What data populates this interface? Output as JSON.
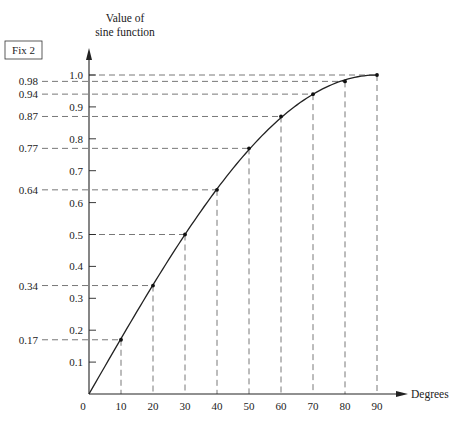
{
  "figure_label": "Fix 2",
  "chart_data": {
    "type": "line",
    "title": "",
    "xlabel": "Degrees",
    "ylabel": "Value of sine function",
    "ylabel_lines": [
      "Value of",
      "sine function"
    ],
    "x": [
      0,
      10,
      20,
      30,
      40,
      50,
      60,
      70,
      80,
      90
    ],
    "values": [
      0,
      0.17,
      0.34,
      0.5,
      0.64,
      0.77,
      0.87,
      0.94,
      0.98,
      1.0
    ],
    "series": [
      {
        "name": "sin(x)",
        "x": [
          0,
          10,
          20,
          30,
          40,
          50,
          60,
          70,
          80,
          90
        ],
        "values": [
          0,
          0.17,
          0.34,
          0.5,
          0.64,
          0.77,
          0.87,
          0.94,
          0.98,
          1.0
        ]
      }
    ],
    "x_ticks": [
      "0",
      "10",
      "20",
      "30",
      "40",
      "50",
      "60",
      "70",
      "80",
      "90"
    ],
    "y_ticks_inner": [
      "0.1",
      "0.2",
      "0.3",
      "0.4",
      "0.5",
      "0.6",
      "0.7",
      "0.8",
      "0.9",
      "1.0"
    ],
    "y_ticks_inner_values": [
      0.1,
      0.2,
      0.3,
      0.4,
      0.5,
      0.6,
      0.7,
      0.8,
      0.9,
      1.0
    ],
    "y_labels_outer": [
      "0.17",
      "0.34",
      "0.64",
      "0.77",
      "0.87",
      "0.94",
      "0.98"
    ],
    "y_labels_outer_values": [
      0.17,
      0.34,
      0.64,
      0.77,
      0.87,
      0.94,
      0.98
    ],
    "xlim": [
      0,
      90
    ],
    "ylim": [
      0,
      1.0
    ],
    "grid": false,
    "guides": "dashed projection lines from each point to both axes",
    "legend": "none",
    "colors": {
      "line": "#222222",
      "guide": "#555555",
      "background": "#ffffff"
    }
  }
}
